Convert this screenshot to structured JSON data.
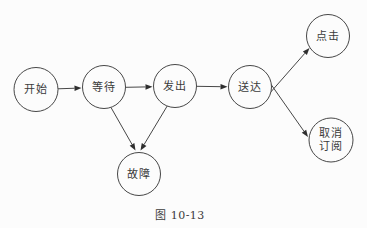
{
  "figure": {
    "type": "state-diagram",
    "caption": "图 10-13",
    "colors": {
      "background": "#fcfcfc",
      "node_fill": "#fcfcfc",
      "stroke": "#474747",
      "arrow_fill": "#2f2f2f",
      "text": "#3b3b3b"
    },
    "nodes": [
      {
        "id": "start",
        "label": "开始",
        "lines": [
          "开始"
        ],
        "x": 36,
        "y": 89.5,
        "r": 22
      },
      {
        "id": "wait",
        "label": "等待",
        "lines": [
          "等待"
        ],
        "x": 104,
        "y": 87,
        "r": 21.5
      },
      {
        "id": "send",
        "label": "发出",
        "lines": [
          "发出"
        ],
        "x": 175,
        "y": 86,
        "r": 21.5
      },
      {
        "id": "delivered",
        "label": "送达",
        "lines": [
          "送达"
        ],
        "x": 250,
        "y": 87,
        "r": 21.5
      },
      {
        "id": "click",
        "label": "点击",
        "lines": [
          "点击"
        ],
        "x": 328,
        "y": 36,
        "r": 21.5
      },
      {
        "id": "unsubscribe",
        "label": "取消订阅",
        "lines": [
          "取消",
          "订阅"
        ],
        "x": 331,
        "y": 140,
        "r": 22
      },
      {
        "id": "failure",
        "label": "故障",
        "lines": [
          "故障"
        ],
        "x": 139,
        "y": 174,
        "r": 21.5
      }
    ],
    "edges": [
      {
        "from": "start",
        "to": "wait",
        "x1": 58,
        "y1": 88.8,
        "x2": 81.5,
        "y2": 88
      },
      {
        "from": "wait",
        "to": "send",
        "x1": 125.5,
        "y1": 87.3,
        "x2": 152.5,
        "y2": 86.8
      },
      {
        "from": "send",
        "to": "delivered",
        "x1": 196.5,
        "y1": 86.3,
        "x2": 227.5,
        "y2": 86.8
      },
      {
        "from": "wait",
        "to": "failure",
        "x1": 111,
        "y1": 107.5,
        "x2": 135.5,
        "y2": 150.5
      },
      {
        "from": "send",
        "to": "failure",
        "x1": 167.5,
        "y1": 105.5,
        "x2": 140.5,
        "y2": 150.5
      },
      {
        "from": "delivered",
        "to": "click",
        "x1": 262,
        "y1": 102,
        "x2": 309.5,
        "y2": 48
      },
      {
        "from": "delivered",
        "to": "unsubscribe",
        "x1": 263,
        "y1": 73,
        "x2": 308,
        "y2": 137
      }
    ]
  }
}
